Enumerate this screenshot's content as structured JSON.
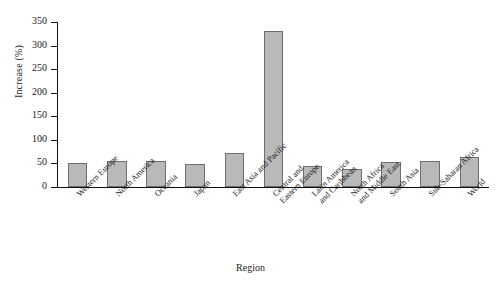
{
  "chart_data": {
    "type": "bar",
    "title": "",
    "xlabel": "Region",
    "ylabel": "Increase (%)",
    "categories": [
      "Western Europe",
      "North America",
      "Oceania",
      "Japan",
      "East Asia and Pacific",
      "Central and\nEastern Europe",
      "Latin America\nand Caribbean",
      "North Africa\nand Middle East",
      "South Asia",
      "Sub-Saharan Africa",
      "World"
    ],
    "values": [
      51,
      55,
      56,
      49,
      73,
      330,
      44,
      39,
      53,
      56,
      64
    ],
    "ylim": [
      0,
      350
    ],
    "yticks": [
      0,
      50,
      100,
      150,
      200,
      250,
      300,
      350
    ],
    "ytick_labels": [
      "0",
      "50",
      "100",
      "150",
      "200",
      "250",
      "300",
      "350"
    ],
    "grid": false,
    "legend": false,
    "bar_color": "#b9b9b9",
    "bar_edge_color": "#6e6e6e",
    "axis_color": "#111111"
  }
}
